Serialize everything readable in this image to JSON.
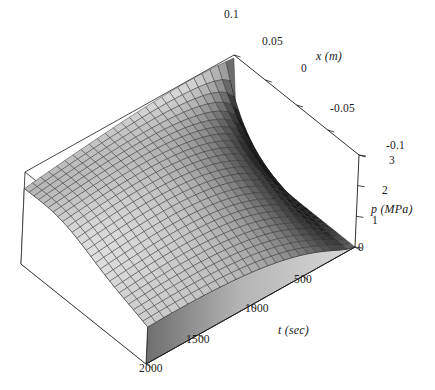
{
  "figure": {
    "width": 435,
    "height": 390,
    "background": "#ffffff",
    "line_color": "#1a1a1a",
    "text_color": "#1a1a1a"
  },
  "chart_data": {
    "type": "surface",
    "title": "",
    "xlabel": "x (m)",
    "ylabel": "t (sec)",
    "zlabel": "p (MPa)",
    "x_axis": {
      "name": "x",
      "unit": "m",
      "label": "x (m)",
      "ticks": [
        0.1,
        0.05,
        0,
        -0.05,
        -0.1
      ],
      "tick_labels": [
        "0.1",
        "0.05",
        "0",
        "-0.05",
        "-0.1"
      ],
      "range": [
        -0.1,
        0.1
      ]
    },
    "y_axis": {
      "name": "t",
      "unit": "sec",
      "label": "t (sec)",
      "ticks": [
        0,
        500,
        1000,
        1500,
        2000
      ],
      "tick_labels": [
        "0",
        "500",
        "1000",
        "1500",
        "2000"
      ],
      "range": [
        0,
        2000
      ],
      "visible_tick_labels": [
        "500",
        "1000",
        "1500",
        "2000"
      ]
    },
    "z_axis": {
      "name": "p",
      "unit": "MPa",
      "label": "p (MPa)",
      "ticks": [
        0,
        1,
        2,
        3
      ],
      "tick_labels": [
        "0",
        "1",
        "2",
        "3"
      ],
      "range": [
        0,
        3
      ]
    },
    "grid": true,
    "legend": "none",
    "mesh": {
      "nx": 26,
      "ny": 26
    },
    "shading": "grayscale-lighting"
  },
  "tick_labels": {
    "x": [
      {
        "text": "0.1",
        "left": 224,
        "top": 9
      },
      {
        "text": "0.05",
        "left": 262,
        "top": 36
      },
      {
        "text": "0",
        "left": 301,
        "top": 63
      },
      {
        "text": "-0.05",
        "left": 330,
        "top": 103
      },
      {
        "text": "-0.1",
        "left": 386,
        "top": 140
      }
    ],
    "t": [
      {
        "text": "500",
        "left": 294,
        "top": 274
      },
      {
        "text": "1000",
        "left": 245,
        "top": 303
      },
      {
        "text": "1500",
        "left": 186,
        "top": 334
      },
      {
        "text": "2000",
        "left": 139,
        "top": 363
      }
    ],
    "p": [
      {
        "text": "3",
        "left": 389,
        "top": 155
      },
      {
        "text": "2",
        "left": 382,
        "top": 185
      },
      {
        "text": "1",
        "left": 372,
        "top": 215
      },
      {
        "text": "0",
        "left": 358,
        "top": 242
      }
    ]
  },
  "axis_titles": {
    "x": {
      "text": "x (m)",
      "left": 316,
      "top": 50
    },
    "t": {
      "text": "t (sec)",
      "left": 278,
      "top": 324
    },
    "p": {
      "text": "p (MPa)",
      "left": 371,
      "top": 203
    }
  }
}
